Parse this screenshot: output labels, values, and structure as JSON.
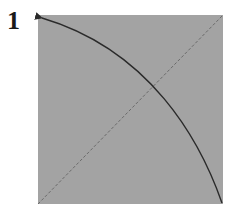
{
  "figure": {
    "label": "1",
    "panel": {
      "fill": "#a3a3a3",
      "x": 38,
      "y": 15,
      "width": 185,
      "height": 189
    },
    "diagonal": {
      "style": "dashed",
      "color": "#6e6e6e",
      "from": "bottom-left",
      "to": "top-right"
    },
    "curve": {
      "color": "#2a2a2a",
      "from": "bottom-right",
      "to": "top-left",
      "arrowhead": "top-left"
    }
  }
}
